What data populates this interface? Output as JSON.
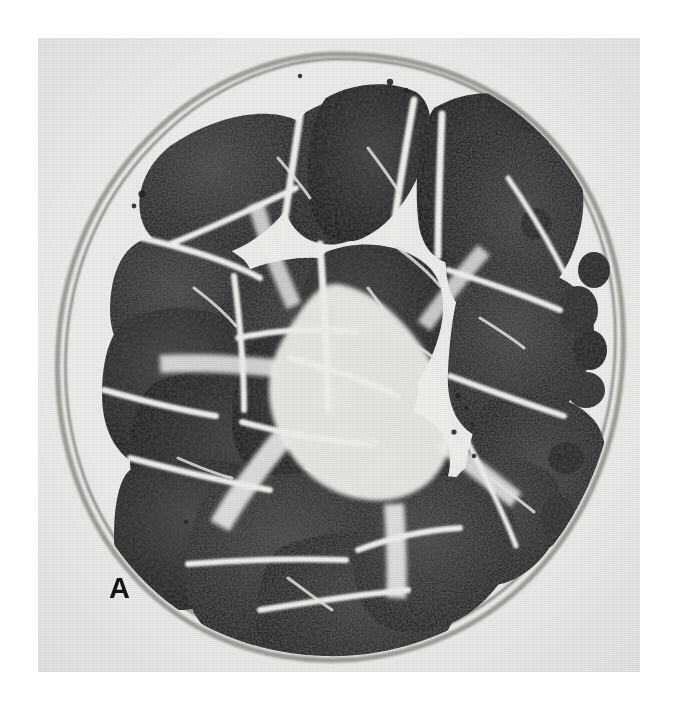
{
  "figure": {
    "panel_label": "A",
    "caption_text": "",
    "modality": "light-microscopy",
    "stain_appearance": "grayscale",
    "specimen": "peripheral nerve cross-section",
    "colors": {
      "page_background": "#ffffff",
      "plate_background": "#eeeeec",
      "septum_light": "#f2f2ef",
      "fascicle_dark": "#2b2b2b",
      "fascicle_mid": "#434343",
      "fascicle_deep": "#1c1c1c",
      "sheath_gray": "#8e8e8a",
      "label_color": "#161616"
    },
    "plate": {
      "x": 38,
      "y": 38,
      "width": 602,
      "height": 634
    }
  }
}
